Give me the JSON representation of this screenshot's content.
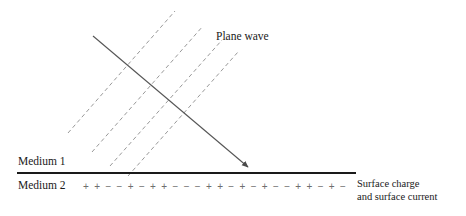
{
  "figure": {
    "labels": {
      "plane_wave": "Plane wave",
      "medium1": "Medium 1",
      "medium2": "Medium 2",
      "surface_line1": "Surface charge",
      "surface_line2": "and surface current"
    },
    "colors": {
      "interface_line": "#1a1a1a",
      "ray_arrow": "#555555",
      "wavefront_dashed": "#999999",
      "charge_symbol": "#6e6e6e",
      "text": "#1a1a1a",
      "background": "#ffffff"
    },
    "interface": {
      "x_start": 17,
      "x_end": 356,
      "y": 173,
      "stroke_width": 2.1
    },
    "ray_arrow": {
      "x1": 93,
      "y1": 36,
      "x2": 250,
      "y2": 169,
      "stroke_width": 1.1,
      "arrowhead": "filled-triangle"
    },
    "wavefronts": {
      "count": 4,
      "dash_pattern": "4 3",
      "stroke_width": 1.0,
      "lines": [
        {
          "x1": 68,
          "y1": 133,
          "x2": 175,
          "y2": 11
        },
        {
          "x1": 92,
          "y1": 152,
          "x2": 203,
          "y2": 26
        },
        {
          "x1": 110,
          "y1": 166,
          "x2": 222,
          "y2": 40
        },
        {
          "x1": 128,
          "y1": 176,
          "x2": 238,
          "y2": 52
        }
      ]
    },
    "surface_charges": [
      "+",
      "+",
      "−",
      "−",
      "+",
      "−",
      "+",
      "+",
      "−",
      "−",
      "−",
      "+",
      "+",
      "−",
      "+",
      "−",
      "+",
      "−",
      "−",
      "+",
      "+",
      "−",
      "+",
      "−"
    ]
  }
}
